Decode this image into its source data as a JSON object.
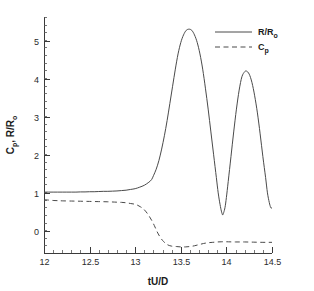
{
  "chart_data": {
    "type": "line",
    "title": "",
    "xlabel": "tU/D",
    "ylabel": "C_p , R/R_o",
    "ylabel_parts": [
      "C",
      "p",
      ", R/R",
      "o"
    ],
    "xlim": [
      12.0,
      14.5
    ],
    "ylim": [
      -0.58,
      5.62
    ],
    "grid": false,
    "legend_position": "top-right",
    "xticks": [
      12,
      12.5,
      13,
      13.5,
      14,
      14.5
    ],
    "xticklabels": [
      "12",
      "12.5",
      "13",
      "13.5",
      "14",
      "14.5"
    ],
    "xminor_per_interval": 5,
    "yticks": [
      0,
      1,
      2,
      3,
      4,
      5
    ],
    "yticklabels": [
      "0",
      "1",
      "2",
      "3",
      "4",
      "5"
    ],
    "yminor_per_interval": 5,
    "series": [
      {
        "name": "R/R_o",
        "legend_label_parts": [
          "R/R",
          "o"
        ],
        "style": "solid",
        "color": "#4a4a4a",
        "points": [
          [
            12.0,
            1.02
          ],
          [
            12.05,
            1.02
          ],
          [
            12.1,
            1.02
          ],
          [
            12.15,
            1.02
          ],
          [
            12.2,
            1.02
          ],
          [
            12.25,
            1.02
          ],
          [
            12.3,
            1.02
          ],
          [
            12.35,
            1.02
          ],
          [
            12.4,
            1.025
          ],
          [
            12.45,
            1.025
          ],
          [
            12.5,
            1.03
          ],
          [
            12.55,
            1.03
          ],
          [
            12.6,
            1.035
          ],
          [
            12.65,
            1.04
          ],
          [
            12.7,
            1.04
          ],
          [
            12.75,
            1.045
          ],
          [
            12.8,
            1.05
          ],
          [
            12.85,
            1.06
          ],
          [
            12.9,
            1.07
          ],
          [
            12.95,
            1.09
          ],
          [
            13.0,
            1.11
          ],
          [
            13.05,
            1.15
          ],
          [
            13.1,
            1.2
          ],
          [
            13.15,
            1.28
          ],
          [
            13.18,
            1.35
          ],
          [
            13.2,
            1.45
          ],
          [
            13.23,
            1.62
          ],
          [
            13.26,
            1.85
          ],
          [
            13.29,
            2.15
          ],
          [
            13.32,
            2.5
          ],
          [
            13.35,
            2.9
          ],
          [
            13.38,
            3.35
          ],
          [
            13.41,
            3.8
          ],
          [
            13.44,
            4.25
          ],
          [
            13.47,
            4.65
          ],
          [
            13.5,
            4.95
          ],
          [
            13.53,
            5.15
          ],
          [
            13.56,
            5.27
          ],
          [
            13.59,
            5.3
          ],
          [
            13.62,
            5.27
          ],
          [
            13.65,
            5.15
          ],
          [
            13.68,
            4.95
          ],
          [
            13.71,
            4.65
          ],
          [
            13.74,
            4.25
          ],
          [
            13.77,
            3.75
          ],
          [
            13.8,
            3.2
          ],
          [
            13.83,
            2.6
          ],
          [
            13.86,
            2.0
          ],
          [
            13.89,
            1.4
          ],
          [
            13.91,
            1.0
          ],
          [
            13.93,
            0.7
          ],
          [
            13.945,
            0.52
          ],
          [
            13.955,
            0.44
          ],
          [
            13.96,
            0.42
          ],
          [
            13.97,
            0.48
          ],
          [
            13.985,
            0.62
          ],
          [
            14.0,
            0.88
          ],
          [
            14.02,
            1.3
          ],
          [
            14.05,
            1.95
          ],
          [
            14.08,
            2.6
          ],
          [
            14.11,
            3.2
          ],
          [
            14.14,
            3.7
          ],
          [
            14.17,
            4.05
          ],
          [
            14.2,
            4.18
          ],
          [
            14.22,
            4.2
          ],
          [
            14.25,
            4.12
          ],
          [
            14.28,
            3.9
          ],
          [
            14.31,
            3.55
          ],
          [
            14.34,
            3.1
          ],
          [
            14.37,
            2.55
          ],
          [
            14.4,
            1.95
          ],
          [
            14.43,
            1.4
          ],
          [
            14.45,
            1.0
          ],
          [
            14.47,
            0.75
          ],
          [
            14.485,
            0.62
          ],
          [
            14.495,
            0.6
          ],
          [
            14.51,
            0.66
          ],
          [
            14.53,
            0.85
          ],
          [
            14.56,
            1.25
          ],
          [
            14.59,
            1.8
          ],
          [
            14.62,
            2.4
          ],
          [
            14.65,
            2.9
          ],
          [
            14.68,
            3.25
          ],
          [
            14.71,
            3.4
          ],
          [
            14.73,
            3.42
          ],
          [
            14.76,
            3.35
          ],
          [
            14.79,
            3.15
          ],
          [
            14.82,
            2.85
          ],
          [
            14.85,
            2.45
          ],
          [
            14.88,
            2.0
          ],
          [
            14.91,
            1.55
          ],
          [
            14.94,
            1.2
          ],
          [
            14.96,
            0.95
          ],
          [
            14.975,
            0.85
          ],
          [
            14.985,
            0.82
          ],
          [
            15.0,
            0.88
          ],
          [
            15.02,
            1.05
          ],
          [
            15.05,
            1.4
          ],
          [
            15.08,
            1.85
          ],
          [
            15.11,
            2.3
          ],
          [
            15.14,
            2.65
          ],
          [
            15.17,
            2.82
          ],
          [
            15.19,
            2.85
          ],
          [
            15.22,
            2.8
          ],
          [
            15.25,
            2.65
          ],
          [
            15.28,
            2.42
          ],
          [
            15.31,
            2.15
          ],
          [
            15.34,
            1.9
          ]
        ]
      },
      {
        "name": "C_p",
        "legend_label_parts": [
          "C",
          "p"
        ],
        "style": "dashed",
        "color": "#4a4a4a",
        "points": [
          [
            12.0,
            0.82
          ],
          [
            12.05,
            0.81
          ],
          [
            12.1,
            0.8
          ],
          [
            12.15,
            0.795
          ],
          [
            12.2,
            0.79
          ],
          [
            12.3,
            0.785
          ],
          [
            12.4,
            0.78
          ],
          [
            12.5,
            0.775
          ],
          [
            12.6,
            0.77
          ],
          [
            12.7,
            0.765
          ],
          [
            12.8,
            0.755
          ],
          [
            12.85,
            0.75
          ],
          [
            12.9,
            0.74
          ],
          [
            12.95,
            0.72
          ],
          [
            13.0,
            0.7
          ],
          [
            13.03,
            0.67
          ],
          [
            13.06,
            0.63
          ],
          [
            13.09,
            0.58
          ],
          [
            13.12,
            0.5
          ],
          [
            13.15,
            0.4
          ],
          [
            13.18,
            0.28
          ],
          [
            13.21,
            0.14
          ],
          [
            13.24,
            -0.02
          ],
          [
            13.27,
            -0.15
          ],
          [
            13.3,
            -0.25
          ],
          [
            13.33,
            -0.32
          ],
          [
            13.36,
            -0.37
          ],
          [
            13.4,
            -0.4
          ],
          [
            13.45,
            -0.41
          ],
          [
            13.5,
            -0.42
          ],
          [
            13.55,
            -0.42
          ],
          [
            13.6,
            -0.41
          ],
          [
            13.65,
            -0.39
          ],
          [
            13.7,
            -0.36
          ],
          [
            13.75,
            -0.33
          ],
          [
            13.8,
            -0.31
          ],
          [
            13.85,
            -0.3
          ],
          [
            13.9,
            -0.29
          ],
          [
            13.95,
            -0.285
          ],
          [
            14.0,
            -0.285
          ],
          [
            14.1,
            -0.29
          ],
          [
            14.2,
            -0.29
          ],
          [
            14.3,
            -0.295
          ],
          [
            14.4,
            -0.3
          ],
          [
            14.5,
            -0.3
          ],
          [
            14.6,
            -0.305
          ],
          [
            14.7,
            -0.305
          ],
          [
            14.8,
            -0.305
          ],
          [
            14.9,
            -0.305
          ],
          [
            15.0,
            -0.305
          ],
          [
            15.1,
            -0.305
          ],
          [
            15.2,
            -0.305
          ],
          [
            15.34,
            -0.305
          ]
        ]
      }
    ]
  },
  "legend": {
    "entries": [
      {
        "label": "R/R_o",
        "style": "solid"
      },
      {
        "label": "C_p",
        "style": "dashed"
      }
    ]
  },
  "colors": {
    "axis": "#3a3a3a",
    "curve": "#4a4a4a",
    "text": "#1a1a1a",
    "background": "#ffffff"
  }
}
